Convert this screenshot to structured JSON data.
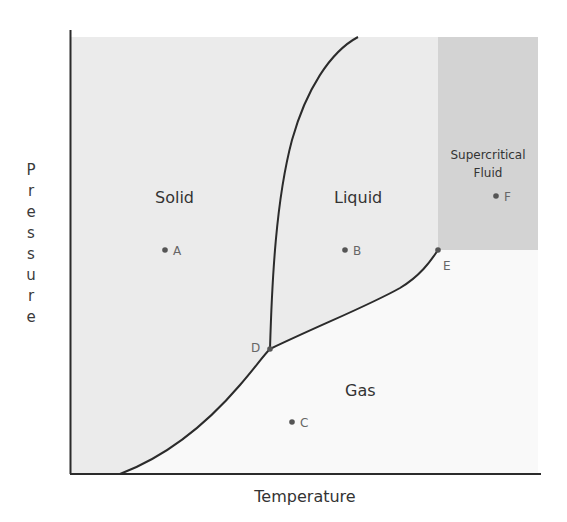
{
  "diagram": {
    "type": "phase-diagram",
    "axes": {
      "xlabel": "Temperature",
      "ylabel": "Pressure"
    },
    "regions": [
      {
        "id": "solid",
        "label": "Solid",
        "fill": "#ebebeb"
      },
      {
        "id": "liquid",
        "label": "Liquid",
        "fill": "#ebebeb"
      },
      {
        "id": "gas",
        "label": "Gas",
        "fill": "#f9f9f9"
      },
      {
        "id": "supercritical",
        "label_line1": "Supercritical",
        "label_line2": "Fluid",
        "fill": "#d3d3d3"
      }
    ],
    "points": [
      {
        "label": "A",
        "x": 165,
        "y": 250,
        "meaning": "solid phase point"
      },
      {
        "label": "B",
        "x": 345,
        "y": 250,
        "meaning": "liquid phase point"
      },
      {
        "label": "C",
        "x": 292,
        "y": 422,
        "meaning": "gas phase point"
      },
      {
        "label": "D",
        "x": 270,
        "y": 349,
        "meaning": "triple point"
      },
      {
        "label": "E",
        "x": 438,
        "y": 250,
        "meaning": "critical point"
      },
      {
        "label": "F",
        "x": 496,
        "y": 196,
        "meaning": "supercritical fluid point"
      }
    ],
    "curves": [
      {
        "name": "sublimation-curve",
        "from": "origin",
        "to": "D"
      },
      {
        "name": "fusion-curve",
        "from": "D",
        "to": "top"
      },
      {
        "name": "vaporization-curve",
        "from": "D",
        "to": "E"
      }
    ],
    "colors": {
      "line": "#2b2b2b",
      "text": "#333333",
      "point_label": "#666666"
    }
  }
}
